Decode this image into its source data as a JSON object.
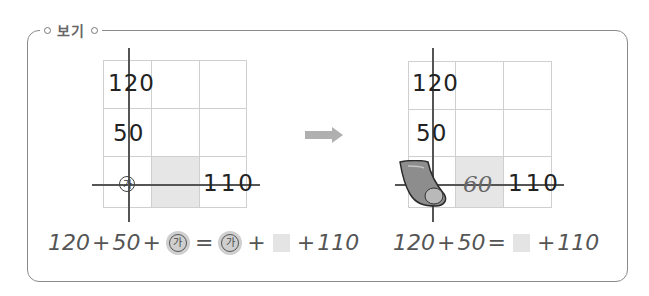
{
  "title": "보기",
  "left_grid": {
    "cells": [
      {
        "row": 0,
        "col": 0,
        "text": "120"
      },
      {
        "row": 1,
        "col": 0,
        "text": "50"
      },
      {
        "row": 2,
        "col": 0,
        "text": "가"
      },
      {
        "row": 2,
        "col": 1,
        "text": "",
        "shaded": true
      },
      {
        "row": 2,
        "col": 2,
        "text": "110"
      }
    ],
    "label_120": "120",
    "label_50": "50",
    "label_ga": "가",
    "label_110": "110"
  },
  "arrow": {
    "icon": "right-arrow-icon",
    "color": "#b0b0b0"
  },
  "right_grid": {
    "label_120": "120",
    "label_50": "50",
    "label_60": "60",
    "label_110": "110",
    "eraser_icon": "eraser-icon"
  },
  "left_equation": {
    "parts": [
      "120",
      "+",
      "50",
      "+",
      "가",
      "=",
      "가",
      "+",
      "□",
      "+",
      "110"
    ],
    "t1": "120",
    "op1": "+",
    "t2": "50",
    "op2": "+",
    "ga1": "가",
    "eq": "=",
    "ga2": "가",
    "op3": "+",
    "op4": "+",
    "t3": "110"
  },
  "right_equation": {
    "parts": [
      "120",
      "+",
      "50",
      "=",
      "□",
      "+",
      "110"
    ],
    "t1": "120",
    "op1": "+",
    "t2": "50",
    "eq": "=",
    "op2": "+",
    "t3": "110"
  },
  "colors": {
    "grid_line": "#cfcfcf",
    "shade": "#e6e6e6",
    "frame": "#8a8a8a",
    "axis": "#555555"
  }
}
